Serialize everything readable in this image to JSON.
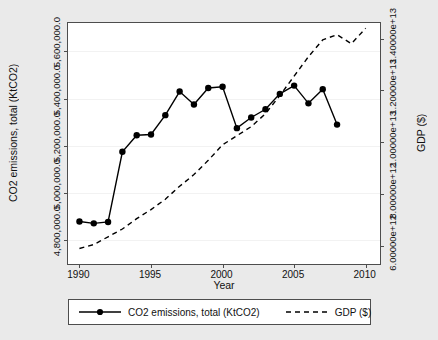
{
  "chart_data": {
    "type": "line",
    "title": "",
    "xlabel": "Year",
    "ylabel": "CO2 emissions, total (KtCO2)",
    "ylabel_right": "GDP ($)",
    "xlim": [
      1989.2,
      2011.0
    ],
    "ylim_left": [
      4700000.0,
      5720000.0
    ],
    "ylim_right": [
      5300000000000,
      14600000000000
    ],
    "grid": true,
    "legend_position": "below-plot",
    "xticks": [
      "1990",
      "1995",
      "2000",
      "2005",
      "2010"
    ],
    "xtick_values": [
      1990,
      1995,
      2000,
      2005,
      2010
    ],
    "yticks_left": [
      "4,800,000.0",
      "5,000,000.0",
      "5,200,000.0",
      "5,400,000.0",
      "5,600,000.0"
    ],
    "ytick_values_left": [
      4800000.0,
      5000000.0,
      5200000.0,
      5400000.0,
      5600000.0
    ],
    "yticks_right": [
      "6.00000e+12",
      "8.00000e+12",
      "1.00000e+13",
      "1.20000e+13",
      "1.40000e+13"
    ],
    "ytick_values_right": [
      6000000000000.0,
      8000000000000.0,
      10000000000000.0,
      12000000000000.0,
      14000000000000.0
    ],
    "series": [
      {
        "name": "CO2 emissions, total (KtCO2)",
        "axis": "left",
        "style": "solid",
        "marker": "filled-circle",
        "color": "#000000",
        "x": [
          1990,
          1991,
          1992,
          1993,
          1994,
          1995,
          1996,
          1997,
          1998,
          1999,
          2000,
          2001,
          2002,
          2003,
          2004,
          2005,
          2006,
          2007,
          2008
        ],
        "values": [
          4880000,
          4872000,
          4878000,
          5175000,
          5245000,
          5248000,
          5330000,
          5430000,
          5375000,
          5445000,
          5450000,
          5275000,
          5320000,
          5355000,
          5420000,
          5455000,
          5380000,
          5440000,
          5290000
        ]
      },
      {
        "name": "GDP ($)",
        "axis": "right",
        "style": "dashed",
        "marker": "none",
        "color": "#000000",
        "x": [
          1990,
          1991,
          1992,
          1993,
          1994,
          1995,
          1996,
          1997,
          1998,
          1999,
          2000,
          2001,
          2002,
          2003,
          2004,
          2005,
          2006,
          2007,
          2008,
          2009,
          2010
        ],
        "values": [
          5900000000000,
          6050000000000,
          6350000000000,
          6650000000000,
          7050000000000,
          7400000000000,
          7800000000000,
          8300000000000,
          8750000000000,
          9300000000000,
          9900000000000,
          10250000000000,
          10600000000000,
          11100000000000,
          11800000000000,
          12550000000000,
          13300000000000,
          13950000000000,
          14150000000000,
          13800000000000,
          14400000000000
        ]
      }
    ]
  },
  "axes": {
    "left_title": "CO2 emissions, total (KtCO2)",
    "right_title": "GDP ($)",
    "x_title": "Year"
  },
  "legend": {
    "items": [
      {
        "label": "CO2 emissions, total (KtCO2)",
        "style": "solid-marker"
      },
      {
        "label": "GDP ($)",
        "style": "dashed"
      }
    ]
  }
}
